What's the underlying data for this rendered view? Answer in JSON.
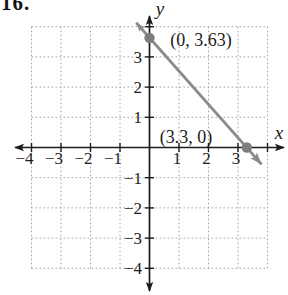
{
  "problem_label": "16.",
  "chart_data": {
    "type": "line",
    "axes": {
      "x_label": "x",
      "y_label": "y",
      "x_range": [
        -4,
        4
      ],
      "y_range": [
        -4,
        4
      ],
      "grid": "dotted",
      "x_ticks": [
        {
          "v": -4,
          "label": "−4"
        },
        {
          "v": -3,
          "label": "−3"
        },
        {
          "v": -2,
          "label": "−2"
        },
        {
          "v": -1,
          "label": "−1"
        },
        {
          "v": 1,
          "label": "1"
        },
        {
          "v": 2,
          "label": "2"
        },
        {
          "v": 3,
          "label": "3"
        }
      ],
      "y_ticks": [
        {
          "v": 3,
          "label": "3"
        },
        {
          "v": 2,
          "label": "2"
        },
        {
          "v": 1,
          "label": "1"
        },
        {
          "v": -1,
          "label": "−1"
        },
        {
          "v": -2,
          "label": "−2"
        },
        {
          "v": -3,
          "label": "−3"
        },
        {
          "v": -4,
          "label": "−4"
        }
      ]
    },
    "series": [
      {
        "name": "plotted-line",
        "points": [
          {
            "x": 0,
            "y": 3.63,
            "label": "(0, 3.63)"
          },
          {
            "x": 3.3,
            "y": 0,
            "label": "(3.3, 0)"
          }
        ],
        "extends": {
          "x1": -0.45,
          "y1": 4.13,
          "x2": 3.8,
          "y2": -0.56
        },
        "y_intercept": 3.63,
        "x_intercept": 3.3
      }
    ],
    "colors": {
      "axis": "#1c1c1c",
      "grid": "#a3a3a3",
      "line": "#8a8a8a",
      "point": "#7d7d7d",
      "point_label": "#8f8f8f"
    }
  }
}
